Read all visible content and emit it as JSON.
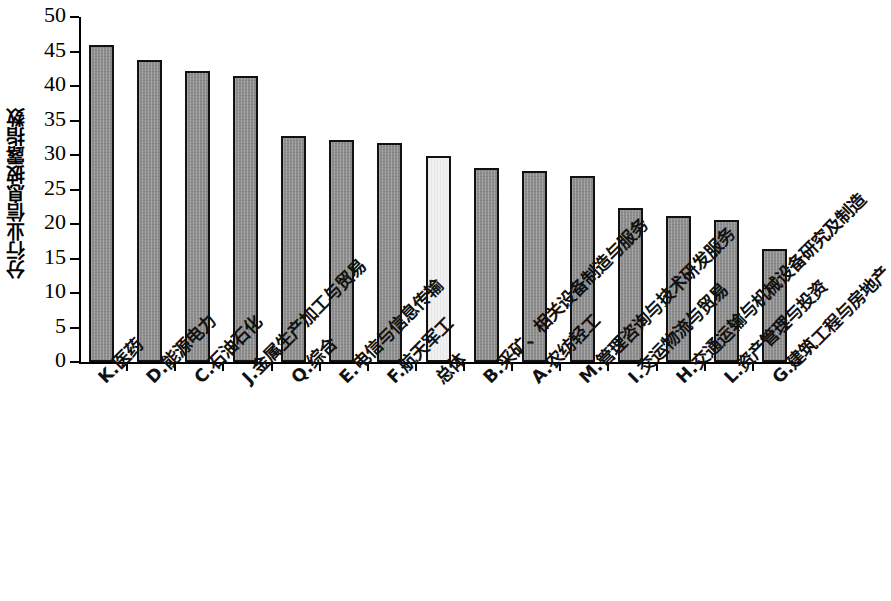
{
  "chart_data": {
    "type": "bar",
    "title": "",
    "subtitle": "",
    "xlabel": "",
    "ylabel": "分行业信息披露指数",
    "ylim": [
      0,
      50
    ],
    "yticks": [
      0,
      5,
      10,
      15,
      20,
      25,
      30,
      35,
      40,
      45,
      50
    ],
    "ytick_labels": [
      "0",
      "5",
      "10",
      "15",
      "20",
      "25",
      "30",
      "35",
      "40",
      "45",
      "50"
    ],
    "grid": false,
    "legend": "none",
    "categories": [
      "K.医药",
      "D.能源电力",
      "C.石油石化",
      "J.金属生产加工与贸易",
      "Q.综合",
      "E.电信与信息传输",
      "F.航天军工",
      "总体",
      "B.采矿、相关设备制造与服务",
      "A.农纺轻工",
      "M.管理咨询与技术研发服务",
      "I.交运物流与贸易",
      "H.交通运输与机械设备研究及制造",
      "L.资产管理与投资",
      "G.建筑工程与房地产"
    ],
    "values": [
      46.0,
      43.7,
      42.2,
      41.5,
      32.8,
      32.2,
      31.8,
      29.9,
      28.1,
      27.7,
      26.9,
      22.3,
      21.2,
      20.6,
      16.4
    ],
    "highlight_index": 7,
    "colors": {
      "bar_fill": "#8d8d8d",
      "bar_highlight_fill": "#f1f1f1",
      "bar_border": "#111111",
      "axis": "#000000",
      "background": "#ffffff"
    }
  }
}
